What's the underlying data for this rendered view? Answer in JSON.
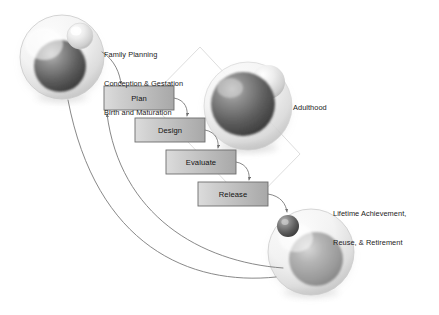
{
  "diagram": {
    "background_color": "#ffffff",
    "process_boxes": [
      {
        "label": "Plan",
        "x": 104,
        "y": 86,
        "w": 70,
        "h": 24
      },
      {
        "label": "Design",
        "x": 135,
        "y": 118,
        "w": 70,
        "h": 24
      },
      {
        "label": "Evaluate",
        "x": 166,
        "y": 150,
        "w": 70,
        "h": 24
      },
      {
        "label": "Release",
        "x": 198,
        "y": 182,
        "w": 70,
        "h": 24
      }
    ],
    "box_style": {
      "fill_light": "#d6d6d6",
      "fill_dark": "#a9a9a9",
      "border_color": "#6d6d6d",
      "text_color": "#111111"
    },
    "stage_labels": [
      {
        "name": "birth-stage-label",
        "lines": [
          "Family Planning",
          "Conception & Gestation",
          "Birth and Maturation"
        ],
        "x": 104,
        "y": 35
      },
      {
        "name": "adulthood-stage-label",
        "lines": [
          "Adulthood"
        ],
        "x": 293,
        "y": 86
      },
      {
        "name": "retirement-stage-label",
        "lines": [
          "Lifetime Achievement,",
          "Reuse, & Retirement"
        ],
        "x": 333,
        "y": 192
      }
    ],
    "spheres": [
      {
        "name": "birth-sphere",
        "cx": 62,
        "cy": 57,
        "r": 42,
        "inner_cx": 60,
        "inner_cy": 65,
        "inner_r": 26,
        "inner_tone": "dark",
        "bud_cx": 80,
        "bud_cy": 35,
        "bud_r": 13,
        "bud_tone": "light"
      },
      {
        "name": "adulthood-sphere",
        "cx": 248,
        "cy": 106,
        "r": 44,
        "inner_cx": 243,
        "inner_cy": 103,
        "inner_r": 32,
        "inner_tone": "dark",
        "bud_cx": 268,
        "bud_cy": 80,
        "bud_r": 17,
        "bud_tone": "light"
      },
      {
        "name": "retirement-sphere",
        "cx": 311,
        "cy": 252,
        "r": 43,
        "inner_cx": 315,
        "inner_cy": 258,
        "inner_r": 27,
        "inner_tone": "mid",
        "bud_cx": 288,
        "bud_cy": 225,
        "bud_r": 11,
        "bud_tone": "dark"
      }
    ],
    "background_diamond": {
      "name": "background-diamond",
      "points": "200,47 300,154 249,206 148,100",
      "stroke": "#dcdcdc"
    },
    "connectors": [
      {
        "name": "plan-to-design-arrow",
        "from": "Plan",
        "to": "Design"
      },
      {
        "name": "design-to-evaluate-arrow",
        "from": "Design",
        "to": "Evaluate"
      },
      {
        "name": "evaluate-to-release-arrow",
        "from": "Evaluate",
        "to": "Release"
      },
      {
        "name": "birth-to-plan-arrow",
        "from": "birth-sphere",
        "to": "Plan"
      },
      {
        "name": "release-to-retirement-arrow",
        "from": "Release",
        "to": "retirement-sphere"
      },
      {
        "name": "retirement-feedback-outer-arc",
        "from": "retirement-sphere",
        "to": "Plan"
      },
      {
        "name": "retirement-feedback-inner-arc",
        "from": "retirement-sphere",
        "to": "Plan"
      }
    ],
    "connector_style": {
      "stroke": "#7a7a7a",
      "width": 0.9
    }
  }
}
